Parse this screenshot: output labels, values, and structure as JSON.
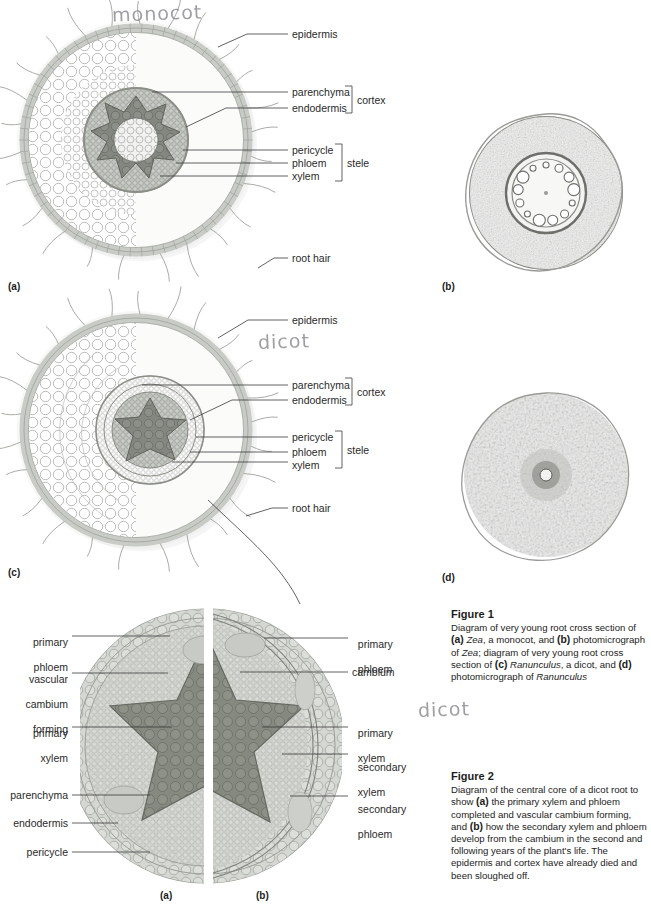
{
  "handwriting": [
    {
      "text": "monocot",
      "x": 112,
      "y": 2
    },
    {
      "text": "dicot",
      "x": 258,
      "y": 330
    },
    {
      "text": "dicot",
      "x": 418,
      "y": 698
    }
  ],
  "figure1": {
    "panel_a": {
      "marker": "(a)",
      "labels": [
        {
          "key": "epidermis",
          "text": "epidermis"
        },
        {
          "key": "parenchyma",
          "text": "parenchyma"
        },
        {
          "key": "endodermis",
          "text": "endodermis"
        },
        {
          "key": "pericycle",
          "text": "pericycle"
        },
        {
          "key": "phloem",
          "text": "phloem"
        },
        {
          "key": "xylem",
          "text": "xylem"
        },
        {
          "key": "root_hair",
          "text": "root hair"
        }
      ],
      "brackets": [
        {
          "key": "cortex",
          "text": "cortex"
        },
        {
          "key": "stele",
          "text": "stele"
        }
      ]
    },
    "panel_b": {
      "marker": "(b)"
    },
    "panel_c": {
      "marker": "(c)",
      "labels": [
        {
          "key": "epidermis",
          "text": "epidermis"
        },
        {
          "key": "parenchyma",
          "text": "parenchyma"
        },
        {
          "key": "endodermis",
          "text": "endodermis"
        },
        {
          "key": "pericycle",
          "text": "pericycle"
        },
        {
          "key": "phloem",
          "text": "phloem"
        },
        {
          "key": "xylem",
          "text": "xylem"
        },
        {
          "key": "root_hair",
          "text": "root hair"
        }
      ],
      "brackets": [
        {
          "key": "cortex",
          "text": "cortex"
        },
        {
          "key": "stele",
          "text": "stele"
        }
      ]
    },
    "panel_d": {
      "marker": "(d)"
    },
    "caption": {
      "title": "Figure 1",
      "body_html": "Diagram of very young root cross section of <b>(a)</b> <span class=\"it\">Zea</span>, a monocot, and <b>(b)</b> photomicrograph of <span class=\"it\">Zea</span>; diagram of very young root cross section of <b>(c)</b> <span class=\"it\">Ranunculus</span>, a dicot, and <b>(d)</b> photomicrograph of <span class=\"it\">Ranunculus</span>"
    }
  },
  "figure2": {
    "panel_a_marker": "(a)",
    "panel_b_marker": "(b)",
    "left_labels": [
      {
        "key": "primary_phloem",
        "line1": "primary",
        "line2": "phloem"
      },
      {
        "key": "vascular_cambium_forming",
        "line1": "vascular",
        "line2": "cambium",
        "line3": "forming"
      },
      {
        "key": "primary_xylem",
        "line1": "primary",
        "line2": "xylem"
      },
      {
        "key": "parenchyma",
        "line1": "parenchyma"
      },
      {
        "key": "endodermis",
        "line1": "endodermis"
      },
      {
        "key": "pericycle",
        "line1": "pericycle"
      }
    ],
    "right_labels": [
      {
        "key": "primary_phloem",
        "line1": "primary",
        "line2": "phloem"
      },
      {
        "key": "cambium",
        "line1": "cambium"
      },
      {
        "key": "primary_xylem",
        "line1": "primary",
        "line2": "xylem"
      },
      {
        "key": "secondary_xylem",
        "line1": "secondary",
        "line2": "xylem"
      },
      {
        "key": "secondary_phloem",
        "line1": "secondary",
        "line2": "phloem"
      }
    ],
    "caption": {
      "title": "Figure 2",
      "body_html": "Diagram of the central core of a dicot root to show <b>(a)</b> the primary xylem and phloem completed and vascular cambium forming, and <b>(b)</b> how the secondary xylem and phloem develop from the cambium in the second and following years of the plant's life. The epidermis and cortex have already died and been sloughed off."
    }
  },
  "colors": {
    "epidermis": "#c9cbc6",
    "cortex_light": "#f4f4f2",
    "stele_mid": "#b9bcb6",
    "xylem_dark": "#7e827c",
    "line": "#3a3a3a",
    "pencil": "#8e8e96"
  }
}
